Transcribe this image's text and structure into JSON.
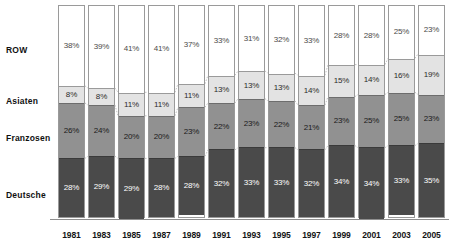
{
  "chart_data": {
    "type": "bar",
    "title": "",
    "subtitle": "",
    "xlabel": "",
    "ylabel": "",
    "ylim": [
      0,
      100
    ],
    "stacked": true,
    "percent_stacked": true,
    "grid": false,
    "legend_position": "left-row-labels",
    "categories": [
      "1981",
      "1983",
      "1985",
      "1987",
      "1989",
      "1991",
      "1993",
      "1995",
      "1997",
      "1999",
      "2001",
      "2003",
      "2005"
    ],
    "series": [
      {
        "name": "Deutsche",
        "color": "#4a4a4a",
        "values": [
          28,
          29,
          29,
          28,
          28,
          32,
          33,
          33,
          32,
          34,
          34,
          33,
          35
        ],
        "labels": [
          "28%",
          "29%",
          "29%",
          "28%",
          "28%",
          "32%",
          "33%",
          "33%",
          "32%",
          "34%",
          "34%",
          "33%",
          "35%"
        ]
      },
      {
        "name": "Franzosen",
        "color": "#919191",
        "values": [
          26,
          24,
          20,
          20,
          23,
          22,
          23,
          22,
          21,
          23,
          25,
          25,
          23
        ],
        "labels": [
          "26%",
          "24%",
          "20%",
          "20%",
          "23%",
          "22%",
          "23%",
          "22%",
          "21%",
          "23%",
          "25%",
          "25%",
          "23%"
        ]
      },
      {
        "name": "Asiaten",
        "color": "#e3e3e3",
        "values": [
          8,
          8,
          11,
          11,
          11,
          13,
          13,
          13,
          14,
          15,
          14,
          16,
          19
        ],
        "labels": [
          "8%",
          "8%",
          "11%",
          "11%",
          "11%",
          "13%",
          "13%",
          "13%",
          "14%",
          "15%",
          "14%",
          "16%",
          "19%"
        ]
      },
      {
        "name": "ROW",
        "color": "#ffffff",
        "values": [
          38,
          39,
          41,
          41,
          37,
          33,
          31,
          32,
          33,
          28,
          28,
          25,
          23
        ],
        "labels": [
          "38%",
          "39%",
          "41%",
          "41%",
          "37%",
          "33%",
          "31%",
          "32%",
          "33%",
          "28%",
          "28%",
          "25%",
          "23%"
        ]
      }
    ],
    "annotations": [
      {
        "name": "marker-dot-1991",
        "series": "Franzosen",
        "category": "1991",
        "shape": "square",
        "color": "#1b1b1b"
      }
    ]
  },
  "row_labels": {
    "row": "ROW",
    "asiaten": "Asiaten",
    "franzosen": "Franzosen",
    "deutsche": "Deutsche"
  },
  "colors": {
    "deutsche": "#4a4a4a",
    "franzosen": "#919191",
    "asiaten": "#e3e3e3",
    "row": "#ffffff",
    "bar_border": "#9a9a9a",
    "axis": "#8f8f8f",
    "connector": "#b0b0b0"
  }
}
